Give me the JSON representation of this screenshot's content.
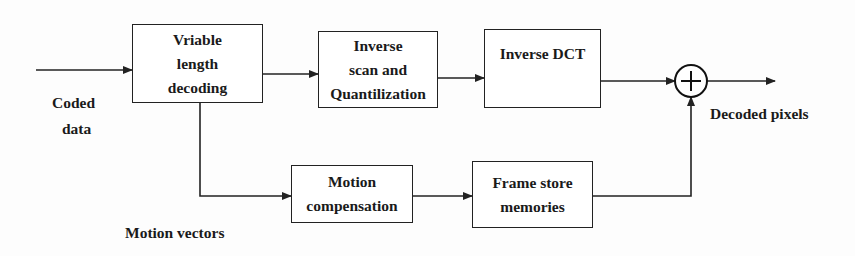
{
  "diagram": {
    "type": "block-diagram",
    "title": "",
    "blocks": {
      "vld": {
        "lines": [
          "Vriable",
          "length",
          "decoding"
        ]
      },
      "inverse_scan": {
        "lines": [
          "Inverse",
          "scan and",
          "Quantilization"
        ]
      },
      "inverse_dct": {
        "lines": [
          "Inverse DCT"
        ]
      },
      "motion_comp": {
        "lines": [
          "Motion",
          "compensation"
        ]
      },
      "frame_store": {
        "lines": [
          "Frame store",
          "memories"
        ]
      },
      "adder": {
        "symbol": "+"
      }
    },
    "labels": {
      "input": [
        "Coded",
        "data"
      ],
      "output": "Decoded pixels",
      "motion_vectors": "Motion vectors"
    },
    "edges": [
      {
        "from": "input",
        "to": "vld"
      },
      {
        "from": "vld",
        "to": "inverse_scan"
      },
      {
        "from": "inverse_scan",
        "to": "inverse_dct"
      },
      {
        "from": "inverse_dct",
        "to": "adder"
      },
      {
        "from": "vld",
        "to": "motion_comp",
        "label": "Motion vectors"
      },
      {
        "from": "motion_comp",
        "to": "frame_store"
      },
      {
        "from": "frame_store",
        "to": "adder"
      },
      {
        "from": "adder",
        "to": "output",
        "label": "Decoded pixels"
      }
    ],
    "colors": {
      "stroke": "#222222",
      "text": "#1a1a1a",
      "background": "#fdfdfd"
    }
  }
}
